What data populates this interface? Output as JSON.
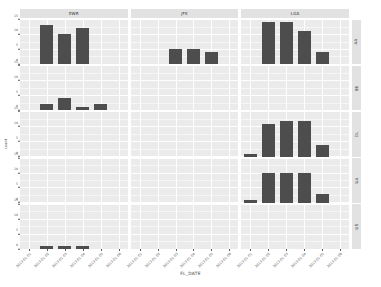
{
  "chart_data": {
    "type": "bar",
    "title": "",
    "xlabel": "FL_DATE",
    "ylabel": "count",
    "grid": true,
    "legend": "none",
    "facet_rows_label": "CARRIER",
    "facet_cols_label": "ORIGIN",
    "facet_cols": [
      "EWR",
      "JFK",
      "LGA"
    ],
    "facet_rows": [
      "AA",
      "B6",
      "DL",
      "UA",
      "US"
    ],
    "categories": [
      "2013-01-01",
      "2013-01-02",
      "2013-01-03",
      "2013-01-04",
      "2013-01-05",
      "2013-01-06"
    ],
    "ylim": [
      0,
      15
    ],
    "yticks": [
      0,
      5,
      10,
      15
    ],
    "panels": [
      {
        "col": "EWR",
        "row": "AA",
        "values": [
          0,
          13,
          10,
          12,
          0,
          0
        ],
        "ymax": 15
      },
      {
        "col": "JFK",
        "row": "AA",
        "values": [
          0,
          0,
          5,
          5,
          4,
          0
        ],
        "ymax": 15
      },
      {
        "col": "LGA",
        "row": "AA",
        "values": [
          0,
          14,
          14,
          11,
          4,
          0
        ],
        "ymax": 15
      },
      {
        "col": "EWR",
        "row": "B6",
        "values": [
          0,
          2,
          4,
          1,
          2,
          0
        ],
        "ymax": 15
      },
      {
        "col": "JFK",
        "row": "B6",
        "values": [
          0,
          0,
          0,
          0,
          0,
          0
        ],
        "ymax": 15
      },
      {
        "col": "LGA",
        "row": "B6",
        "values": [
          0,
          0,
          0,
          0,
          0,
          0
        ],
        "ymax": 15
      },
      {
        "col": "EWR",
        "row": "DL",
        "values": [
          0,
          0,
          0,
          0,
          0,
          0
        ],
        "ymax": 15
      },
      {
        "col": "JFK",
        "row": "DL",
        "values": [
          0,
          0,
          0,
          0,
          0,
          0
        ],
        "ymax": 15
      },
      {
        "col": "LGA",
        "row": "DL",
        "values": [
          1,
          11,
          12,
          12,
          4,
          0
        ],
        "ymax": 15
      },
      {
        "col": "EWR",
        "row": "UA",
        "values": [
          0,
          0,
          0,
          0,
          0,
          0
        ],
        "ymax": 15
      },
      {
        "col": "JFK",
        "row": "UA",
        "values": [
          0,
          0,
          0,
          0,
          0,
          0
        ],
        "ymax": 15
      },
      {
        "col": "LGA",
        "row": "UA",
        "values": [
          1,
          10,
          10,
          10,
          3,
          0
        ],
        "ymax": 15
      },
      {
        "col": "EWR",
        "row": "US",
        "values": [
          0,
          1,
          1,
          1,
          0,
          0
        ],
        "ymax": 15
      },
      {
        "col": "JFK",
        "row": "US",
        "values": [
          0,
          0,
          0,
          0,
          0,
          0
        ],
        "ymax": 15
      },
      {
        "col": "LGA",
        "row": "US",
        "values": [
          0,
          0,
          0,
          0,
          0,
          0
        ],
        "ymax": 15
      }
    ]
  },
  "axes": {
    "x_title": "FL_DATE",
    "y_title": "count",
    "x_tick_labels": [
      "2013-01-01",
      "2013-01-02",
      "2013-01-03",
      "2013-01-04",
      "2013-01-05",
      "2013-01-06"
    ],
    "y_tick_labels": [
      "0",
      "5",
      "10",
      "15"
    ]
  },
  "strips": {
    "top": [
      "EWR",
      "JFK",
      "LGA"
    ],
    "right": [
      "AA",
      "B6",
      "DL",
      "UA",
      "US"
    ]
  },
  "colors": {
    "bar": "#4d4d4d",
    "panel": "#ebebeb",
    "strip": "#e2e2e2",
    "gridline": "#ffffff",
    "text": "#4f4f4f",
    "background": "#ffffff"
  }
}
